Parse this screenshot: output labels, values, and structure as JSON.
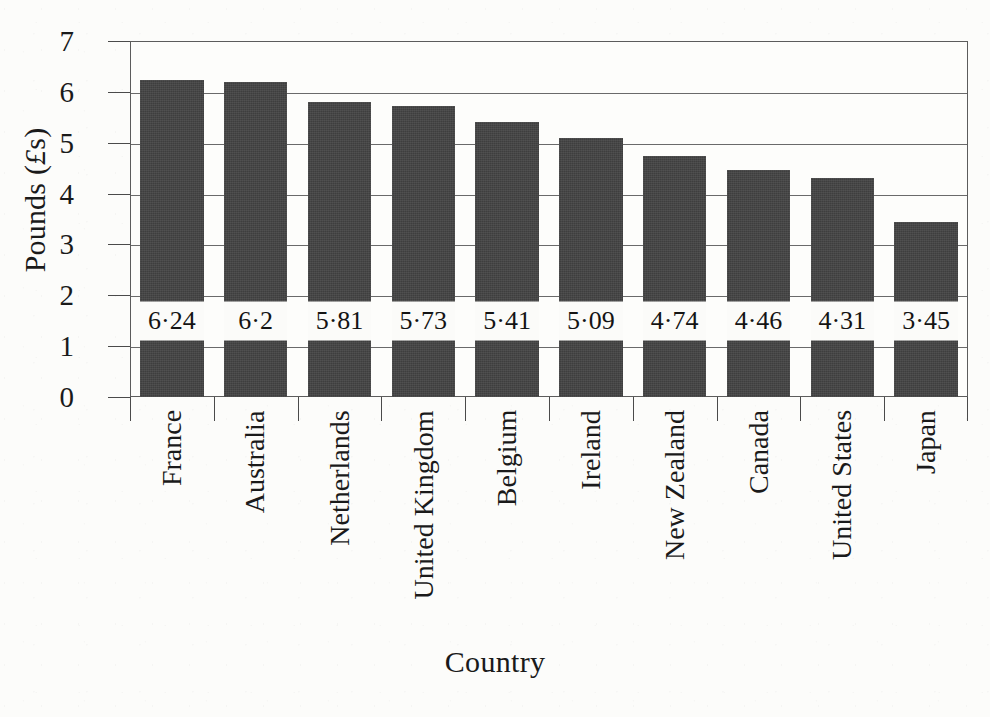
{
  "chart_data": {
    "type": "bar",
    "title": "",
    "subtitle": "",
    "xlabel": "Country",
    "ylabel": "Pounds (£s)",
    "ylabel_parts": {
      "prefix": "Pounds (",
      "currency": "£",
      "suffix": "s)"
    },
    "categories": [
      "France",
      "Australia",
      "Netherlands",
      "United Kingdom",
      "Belgium",
      "Ireland",
      "New Zealand",
      "Canada",
      "United States",
      "Japan"
    ],
    "values": [
      6.24,
      6.2,
      5.81,
      5.73,
      5.41,
      5.09,
      4.74,
      4.46,
      4.31,
      3.45
    ],
    "value_labels": [
      "6·24",
      "6·2",
      "5·81",
      "5·73",
      "5·41",
      "5·09",
      "4·74",
      "4·46",
      "4·31",
      "3·45"
    ],
    "ylim": [
      0,
      7
    ],
    "yticks": [
      0,
      1,
      2,
      3,
      4,
      5,
      6,
      7
    ],
    "ytick_labels": [
      "0",
      "1",
      "2",
      "3",
      "4",
      "5",
      "6",
      "7"
    ],
    "grid": true,
    "grid_axis": "y",
    "legend": false,
    "legend_position": "none",
    "label_value_position": 1.5,
    "colors": {
      "bar_fill": "#3e3e3e",
      "background": "#fcfcfa",
      "plot_background": "#fdfdfb",
      "axis_line": "#5c5c5c",
      "gridline": "#6a6a6a",
      "text": "#1a1a1a",
      "value_label_background": "#fbfbf9"
    }
  }
}
